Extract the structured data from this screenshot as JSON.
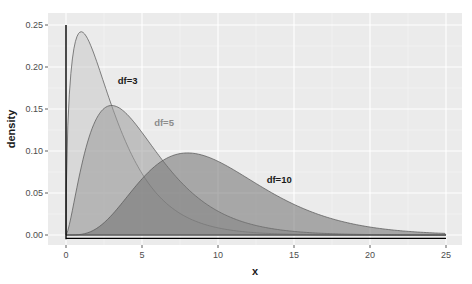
{
  "chart_data": {
    "type": "area",
    "title": "",
    "xlabel": "x",
    "ylabel": "density",
    "xlim": [
      -1.2,
      25.6
    ],
    "ylim": [
      -0.0125,
      0.2625
    ],
    "x_ticks": [
      0,
      5,
      10,
      15,
      20,
      25
    ],
    "x_tick_labels": [
      "0",
      "5",
      "10",
      "15",
      "20",
      "25"
    ],
    "y_ticks": [
      0.0,
      0.05,
      0.1,
      0.15,
      0.2,
      0.25
    ],
    "y_tick_labels": [
      "0.00",
      "0.05",
      "0.10",
      "0.15",
      "0.20",
      "0.25"
    ],
    "grid": true,
    "legend": "none",
    "series": [
      {
        "name": "df=3",
        "df": 3,
        "peak_x": 1,
        "peak_density": 0.242,
        "fill": "#c8c8c8",
        "fill_opacity": 0.55,
        "label_color": "#1a1a1a",
        "label_x": 3.4,
        "label_y": 0.18
      },
      {
        "name": "df=5",
        "df": 5,
        "peak_x": 3,
        "peak_density": 0.154,
        "fill": "#9a9a9a",
        "fill_opacity": 0.55,
        "label_color": "#8c8c8c",
        "label_x": 5.8,
        "label_y": 0.13
      },
      {
        "name": "df=10",
        "df": 10,
        "peak_x": 8,
        "peak_density": 0.098,
        "fill": "#707070",
        "fill_opacity": 0.55,
        "label_color": "#1a1a1a",
        "label_x": 13.2,
        "label_y": 0.062
      }
    ],
    "x_sample": [
      0,
      1,
      2,
      3,
      4,
      5,
      6,
      8,
      10,
      12,
      15,
      20,
      25
    ],
    "values_df3": [
      0.0,
      0.242,
      0.208,
      0.154,
      0.108,
      0.073,
      0.048,
      0.02,
      0.0085,
      0.0035,
      0.0008,
      0.0001,
      0.0
    ],
    "values_df5": [
      0.0,
      0.081,
      0.138,
      0.154,
      0.144,
      0.122,
      0.097,
      0.055,
      0.028,
      0.013,
      0.0036,
      0.0004,
      0.0
    ],
    "values_df10": [
      0.0,
      0.0008,
      0.0153,
      0.0471,
      0.0902,
      0.0668,
      0.084,
      0.0977,
      0.0877,
      0.0669,
      0.0367,
      0.0092,
      0.0019
    ]
  },
  "labels": {
    "xlabel": "x",
    "ylabel": "density",
    "x_ticks": [
      "0",
      "5",
      "10",
      "15",
      "20",
      "25"
    ],
    "y_ticks": [
      "0.00",
      "0.05",
      "0.10",
      "0.15",
      "0.20",
      "0.25"
    ],
    "annot_df3": "df=3",
    "annot_df5": "df=5",
    "annot_df10": "df=10"
  }
}
